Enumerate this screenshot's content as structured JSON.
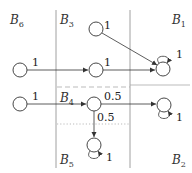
{
  "blocks": [
    {
      "id": "B6",
      "base": "B",
      "sub": "6"
    },
    {
      "id": "B3",
      "base": "B",
      "sub": "3"
    },
    {
      "id": "B1",
      "base": "B",
      "sub": "1"
    },
    {
      "id": "B4",
      "base": "B",
      "sub": "4"
    },
    {
      "id": "B5",
      "base": "B",
      "sub": "5"
    },
    {
      "id": "B2",
      "base": "B",
      "sub": "2"
    }
  ],
  "edges": [
    {
      "from": "B6-top",
      "to": "B3-mid",
      "weight": "1"
    },
    {
      "from": "B3-top",
      "to": "B1",
      "weight": "1"
    },
    {
      "from": "B3-mid",
      "to": "B1",
      "weight": "1"
    },
    {
      "from": "B1",
      "to": "B1",
      "weight": "1",
      "self_loop": true
    },
    {
      "from": "B6-bottom",
      "to": "B4",
      "weight": "1"
    },
    {
      "from": "B4",
      "to": "B2",
      "weight": "0.5"
    },
    {
      "from": "B4",
      "to": "B5",
      "weight": "0.5"
    },
    {
      "from": "B2",
      "to": "B2",
      "weight": "1",
      "self_loop": true
    },
    {
      "from": "B5",
      "to": "B5",
      "weight": "1",
      "self_loop": true
    }
  ],
  "colors": {
    "line": "#333333",
    "divider": "#888888",
    "dashed": "#aaaaaa"
  }
}
